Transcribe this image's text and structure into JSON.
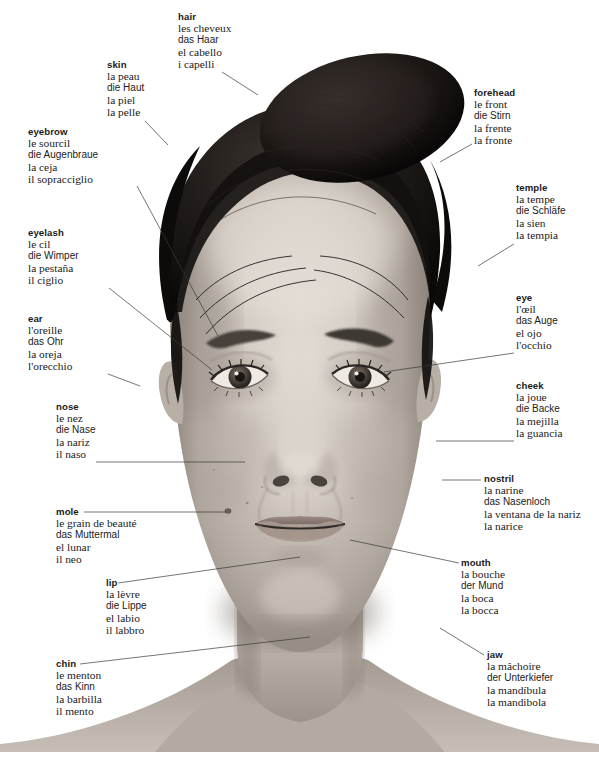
{
  "diagram": {
    "languages": [
      "English",
      "French",
      "German",
      "Spanish",
      "Italian"
    ],
    "background_color": "#ffffff",
    "text_color": "#1b1b1b",
    "leader_line_color": "#3a3a3a"
  },
  "labels": [
    {
      "id": "hair",
      "term": "hair",
      "fr": "les cheveux",
      "de": "das Haar",
      "es": "el cabello",
      "it": "i capelli",
      "x": 178,
      "y": 12,
      "align": "left",
      "leader": [
        [
          222,
          72
        ],
        [
          258,
          95
        ]
      ]
    },
    {
      "id": "skin",
      "term": "skin",
      "fr": "la peau",
      "de": "die Haut",
      "es": "la piel",
      "it": "la pelle",
      "x": 107,
      "y": 60,
      "align": "left",
      "leader": [
        [
          145,
          121
        ],
        [
          168,
          145
        ]
      ]
    },
    {
      "id": "forehead",
      "term": "forehead",
      "fr": "le front",
      "de": "die Stirn",
      "es": "la frente",
      "it": "la fronte",
      "x": 474,
      "y": 88,
      "align": "left",
      "leader": [
        [
          472,
          144
        ],
        [
          440,
          162
        ]
      ]
    },
    {
      "id": "eyebrow",
      "term": "eyebrow",
      "fr": "le sourcil",
      "de": "die Augenbraue",
      "es": "la ceja",
      "it": "il sopracciglio",
      "x": 28,
      "y": 127,
      "align": "left",
      "leader": [
        [
          137,
          186
        ],
        [
          218,
          336
        ]
      ]
    },
    {
      "id": "temple",
      "term": "temple",
      "fr": "la tempe",
      "de": "die Schläfe",
      "es": "la sien",
      "it": "la tempia",
      "x": 516,
      "y": 183,
      "align": "left",
      "leader": [
        [
          514,
          244
        ],
        [
          478,
          266
        ]
      ]
    },
    {
      "id": "eyelash",
      "term": "eyelash",
      "fr": "le cil",
      "de": "die Wimper",
      "es": "la pestaña",
      "it": "il ciglio",
      "x": 28,
      "y": 228,
      "align": "left",
      "leader": [
        [
          109,
          288
        ],
        [
          212,
          370
        ]
      ]
    },
    {
      "id": "eye",
      "term": "eye",
      "fr": "l'œil",
      "de": "das Auge",
      "es": "el ojo",
      "it": "l'occhio",
      "x": 516,
      "y": 293,
      "align": "left",
      "leader": [
        [
          514,
          353
        ],
        [
          384,
          372
        ]
      ]
    },
    {
      "id": "ear",
      "term": "ear",
      "fr": "l'oreille",
      "de": "das Ohr",
      "es": "la oreja",
      "it": "l'orecchio",
      "x": 28,
      "y": 314,
      "align": "left",
      "leader": [
        [
          108,
          374
        ],
        [
          140,
          386
        ]
      ]
    },
    {
      "id": "cheek",
      "term": "cheek",
      "fr": "la joue",
      "de": "die Backe",
      "es": "la mejilla",
      "it": "la guancia",
      "x": 516,
      "y": 381,
      "align": "left",
      "leader": [
        [
          514,
          441
        ],
        [
          436,
          441
        ]
      ]
    },
    {
      "id": "nose",
      "term": "nose",
      "fr": "le nez",
      "de": "die Nase",
      "es": "la nariz",
      "it": "il naso",
      "x": 56,
      "y": 402,
      "align": "left",
      "leader": [
        [
          96,
          462
        ],
        [
          245,
          462
        ]
      ]
    },
    {
      "id": "nostril",
      "term": "nostril",
      "fr": "la narine",
      "de": "das Nasenloch",
      "es": "la ventana de la nariz",
      "it": "la narice",
      "x": 484,
      "y": 474,
      "align": "left",
      "leader": [
        [
          481,
          480
        ],
        [
          442,
          480
        ]
      ]
    },
    {
      "id": "mole",
      "term": "mole",
      "fr": "le grain de beauté",
      "de": "das Muttermal",
      "es": "el lunar",
      "it": "il neo",
      "x": 56,
      "y": 507,
      "align": "left",
      "leader": [
        [
          84,
          512
        ],
        [
          226,
          512
        ]
      ]
    },
    {
      "id": "mouth",
      "term": "mouth",
      "fr": "la bouche",
      "de": "der Mund",
      "es": "la boca",
      "it": "la bocca",
      "x": 461,
      "y": 558,
      "align": "left",
      "leader": [
        [
          459,
          563
        ],
        [
          350,
          540
        ]
      ]
    },
    {
      "id": "lip",
      "term": "lip",
      "fr": "la lèvre",
      "de": "die Lippe",
      "es": "el labio",
      "it": "il labbro",
      "x": 106,
      "y": 578,
      "align": "left",
      "leader": [
        [
          118,
          583
        ],
        [
          300,
          557
        ]
      ]
    },
    {
      "id": "jaw",
      "term": "jaw",
      "fr": "la mâchoire",
      "de": "der Unterkiefer",
      "es": "la mandíbula",
      "it": "la mandibola",
      "x": 487,
      "y": 650,
      "align": "left",
      "leader": [
        [
          484,
          655
        ],
        [
          440,
          628
        ]
      ]
    },
    {
      "id": "chin",
      "term": "chin",
      "fr": "le menton",
      "de": "das Kinn",
      "es": "la barbilla",
      "it": "il mento",
      "x": 56,
      "y": 659,
      "align": "left",
      "leader": [
        [
          80,
          664
        ],
        [
          310,
          637
        ]
      ]
    }
  ]
}
